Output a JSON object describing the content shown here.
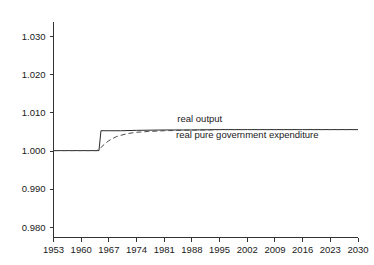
{
  "chart_data": {
    "type": "line",
    "title": "",
    "subtitle": "",
    "xlabel": "",
    "ylabel": "",
    "xlim": [
      1953,
      2030
    ],
    "ylim": [
      0.98,
      1.03
    ],
    "grid": false,
    "legend_position": "inline-annotations",
    "x_ticks": [
      "1953",
      "1960",
      "1967",
      "1974",
      "1981",
      "1988",
      "1995",
      "2002",
      "2009",
      "2016",
      "2023",
      "2030"
    ],
    "y_ticks": [
      "1.030",
      "1.020",
      "1.010",
      "1.000",
      "0.990",
      "0.980"
    ],
    "annotations": [
      {
        "name": "real-output-label",
        "text": "real output",
        "x": 1990,
        "y": 1.0075
      },
      {
        "name": "real-pure-government-expenditure-label",
        "text": "real pure government expenditure",
        "x": 2002,
        "y": 1.0033
      }
    ],
    "series": [
      {
        "name": "real pure government expenditure",
        "style": "solid",
        "color": "#2b2b2b",
        "x": [
          1953,
          1954,
          1955,
          1956,
          1957,
          1958,
          1959,
          1960,
          1961,
          1962,
          1963,
          1964,
          1964.5,
          1965,
          1966,
          1967,
          1970,
          1974,
          1981,
          1988,
          1995,
          2002,
          2009,
          2016,
          2023,
          2030
        ],
        "values": [
          1.0,
          1.0,
          1.0,
          1.0,
          1.0,
          1.0,
          1.0,
          1.0,
          1.0,
          1.0,
          1.0,
          1.0,
          1.0,
          1.0052,
          1.0052,
          1.0052,
          1.0052,
          1.0053,
          1.0054,
          1.0054,
          1.0055,
          1.0055,
          1.0055,
          1.0055,
          1.0055,
          1.0055
        ]
      },
      {
        "name": "real output",
        "style": "dashed",
        "color": "#4a4a4a",
        "x": [
          1953,
          1956,
          1959,
          1962,
          1964,
          1965,
          1966,
          1967,
          1968,
          1969,
          1970,
          1972,
          1974,
          1977,
          1981,
          1985,
          1988,
          1992,
          1995,
          2000,
          2002,
          2009,
          2016,
          2023,
          2030
        ],
        "values": [
          1.0,
          1.0,
          1.0,
          1.0,
          1.0,
          1.0008,
          1.0018,
          1.0026,
          1.0032,
          1.0037,
          1.004,
          1.0045,
          1.0048,
          1.005,
          1.0052,
          1.0053,
          1.0054,
          1.0054,
          1.0055,
          1.0055,
          1.0055,
          1.0055,
          1.0055,
          1.0055,
          1.0055
        ]
      }
    ]
  },
  "colors": {
    "axis": "#333333",
    "text": "#1a1a1a",
    "background": "#ffffff",
    "solid_series": "#2b2b2b",
    "dashed_series": "#4a4a4a"
  }
}
